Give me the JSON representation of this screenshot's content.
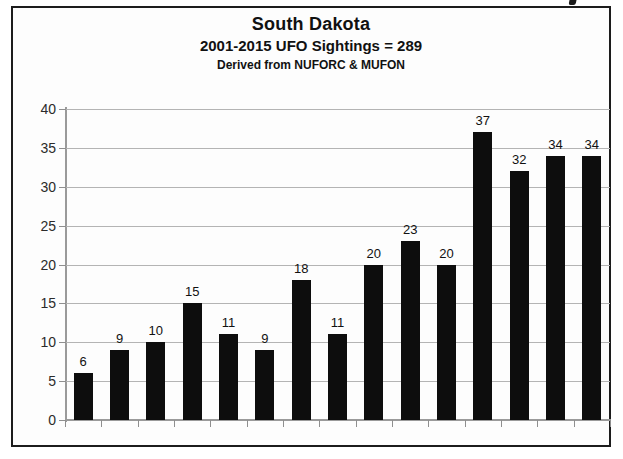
{
  "chart_data": {
    "type": "bar",
    "title": "South Dakota",
    "subtitle": "2001-2015 UFO Sightings = 289",
    "source_note": "Derived from NUFORC & MUFON",
    "xlabel": "",
    "ylabel": "",
    "categories": [
      "2001",
      "2002",
      "2003",
      "2004",
      "2005",
      "2006",
      "2007",
      "2008",
      "2009",
      "2010",
      "2011",
      "2012",
      "2013",
      "2014",
      "2015"
    ],
    "values": [
      6,
      9,
      10,
      15,
      11,
      9,
      18,
      11,
      20,
      23,
      20,
      37,
      32,
      34,
      34
    ],
    "data_labels": [
      "6",
      "9",
      "10",
      "15",
      "11",
      "9",
      "18",
      "11",
      "20",
      "23",
      "20",
      "37",
      "32",
      "34",
      "34"
    ],
    "ylim": [
      0,
      40
    ],
    "ytick_labels": [
      "0",
      "5",
      "10",
      "15",
      "20",
      "25",
      "30",
      "35",
      "40"
    ],
    "ytick_values": [
      0,
      5,
      10,
      15,
      20,
      25,
      30,
      35,
      40
    ],
    "grid": "horizontal",
    "legend": "none",
    "bar_color": "#0d0d0d",
    "gridline_color": "#b4b4b4",
    "axis_color": "#9a9a9a",
    "frame_color": "#1c1c1c",
    "background_color": "#fdfdfd",
    "text_color": "#111111"
  }
}
